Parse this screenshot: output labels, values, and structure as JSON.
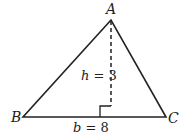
{
  "diagram": {
    "type": "triangle",
    "vertices": {
      "A": {
        "label": "A",
        "x": 111,
        "y": 20
      },
      "B": {
        "label": "B",
        "x": 23,
        "y": 117
      },
      "C": {
        "label": "C",
        "x": 166,
        "y": 117
      }
    },
    "height": {
      "var": "h",
      "eq": " = 3",
      "style": "dashed"
    },
    "base": {
      "var": "b",
      "eq": " = 8"
    },
    "right_angle_marker": true,
    "colors": {
      "stroke": "#222222",
      "background": "#ffffff"
    }
  }
}
